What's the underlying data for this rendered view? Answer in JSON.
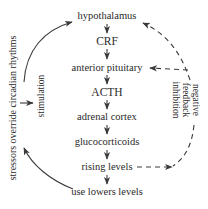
{
  "diagram": {
    "nodes": [
      {
        "id": "hypothalamus",
        "label": "hypothalamus"
      },
      {
        "id": "crf",
        "label": "CRF"
      },
      {
        "id": "anterior-pituitary",
        "label": "anterior pituitary"
      },
      {
        "id": "acth",
        "label": "ACTH"
      },
      {
        "id": "adrenal-cortex",
        "label": "adrenal cortex"
      },
      {
        "id": "glucocorticoids",
        "label": "glucocorticoids"
      },
      {
        "id": "rising-levels",
        "label": "rising levels"
      },
      {
        "id": "use-lowers-levels",
        "label": "use lowers levels"
      }
    ],
    "left_labels": {
      "outer": "stressors override circadian rhythms",
      "inner": "stimulation"
    },
    "right_labels": {
      "line1": "negative",
      "line2": "feedback",
      "line3": "inhibition"
    },
    "edges": [
      {
        "from": "hypothalamus",
        "to": "CRF",
        "style": "solid"
      },
      {
        "from": "CRF",
        "to": "anterior pituitary",
        "style": "solid"
      },
      {
        "from": "anterior pituitary",
        "to": "ACTH",
        "style": "solid"
      },
      {
        "from": "ACTH",
        "to": "adrenal cortex",
        "style": "solid"
      },
      {
        "from": "adrenal cortex",
        "to": "glucocorticoids",
        "style": "solid"
      },
      {
        "from": "glucocorticoids",
        "to": "rising levels",
        "style": "solid"
      },
      {
        "from": "rising levels",
        "to": "use lowers levels",
        "style": "solid"
      },
      {
        "from": "use lowers levels",
        "to": "hypothalamus",
        "style": "solid-curved-left"
      },
      {
        "from": "rising levels",
        "to": "hypothalamus",
        "style": "dashed-curved-right"
      },
      {
        "from": "rising levels",
        "to": "anterior pituitary",
        "style": "dashed-curved-right"
      }
    ],
    "colors": {
      "ink": "#2a2a2a",
      "background": "#ffffff"
    }
  }
}
